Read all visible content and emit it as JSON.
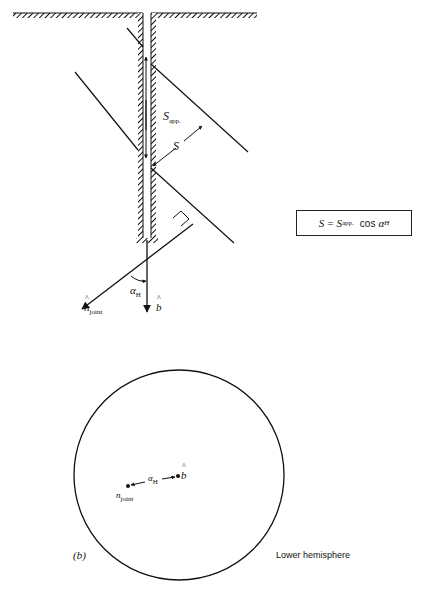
{
  "figure": {
    "panel_a": {
      "labels": {
        "s_app": "S",
        "s_app_sub": "app.",
        "s": "S",
        "alpha": "α",
        "alpha_sub": "H",
        "n_joint": "n",
        "n_joint_sub": "joint",
        "b": "b"
      },
      "formula": {
        "lhs": "S",
        "equals": "=",
        "rhs_var": "S",
        "rhs_sub": "app.",
        "cos": "cos",
        "alpha": "α",
        "alpha_sub": "H"
      }
    },
    "panel_b": {
      "panel_label": "(b)",
      "hemisphere_label": "Lower hemisphere",
      "labels": {
        "n_joint": "n",
        "n_joint_sub": "joint",
        "alpha": "α",
        "alpha_sub": "H",
        "b": "b"
      }
    }
  },
  "colors": {
    "ink": "#111111",
    "background": "#ffffff"
  }
}
